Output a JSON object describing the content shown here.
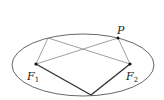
{
  "diagram": {
    "type": "ellipse-foci",
    "ellipse": {
      "cx": 83,
      "cy": 65,
      "rx": 71,
      "ry": 31,
      "stroke": "#555555"
    },
    "points": {
      "F1": {
        "x": 36,
        "y": 64,
        "label": "F",
        "sub": "1"
      },
      "F2": {
        "x": 130,
        "y": 64,
        "label": "F",
        "sub": "2"
      },
      "P": {
        "x": 118,
        "y": 38,
        "label": "P"
      },
      "Q": {
        "x": 48,
        "y": 38
      },
      "B": {
        "x": 91,
        "y": 95
      }
    },
    "thin_segments": [
      [
        "F1",
        "Q"
      ],
      [
        "Q",
        "F2"
      ],
      [
        "F1",
        "P"
      ],
      [
        "P",
        "F2"
      ]
    ],
    "thick_segments": [
      [
        "F1",
        "B"
      ],
      [
        "B",
        "F2"
      ]
    ],
    "colors": {
      "thin": "#888888",
      "thick": "#333333",
      "dot": "#111111"
    }
  }
}
